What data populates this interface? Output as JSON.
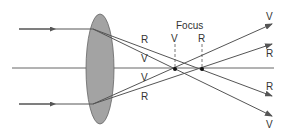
{
  "diagram": {
    "focus_label": "Focus",
    "focus_points": [
      {
        "label": "V",
        "x": 175
      },
      {
        "label": "R",
        "x": 202
      }
    ],
    "ray_labels_near_lens": [
      "R",
      "V",
      "V",
      "R"
    ],
    "ray_labels_right": [
      "V",
      "R",
      "R",
      "V"
    ],
    "colors": {
      "line": "#555555",
      "lens": "#a0a0a0",
      "lens_stroke": "#666666",
      "text": "#333333"
    }
  }
}
